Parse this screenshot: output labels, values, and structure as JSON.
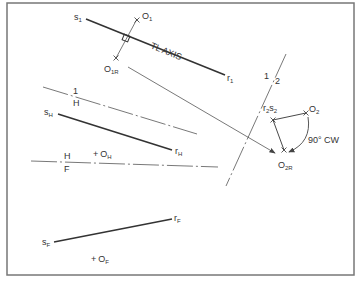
{
  "figure": {
    "frame": {
      "x": 7,
      "y": 3,
      "width": 347,
      "height": 272,
      "stroke": "#777777"
    },
    "colors": {
      "line": "#333333",
      "thin": "#555555",
      "text": "#333333"
    },
    "line_1": {
      "start_label": "s",
      "start_sub": "1",
      "end_label": "r",
      "end_sub": "1",
      "axis_label": "TL AXIS"
    },
    "point_O1": {
      "label": "O",
      "sub": "1"
    },
    "point_O1R": {
      "label": "O",
      "sub": "1R"
    },
    "fold_1H": {
      "top": "1",
      "bottom": "H"
    },
    "line_H": {
      "start_label": "s",
      "start_sub": "H",
      "end_label": "r",
      "end_sub": "H"
    },
    "point_OH": {
      "marker": "+",
      "label": "O",
      "sub": "H"
    },
    "fold_HF": {
      "top": "H",
      "bottom": "F"
    },
    "fold_12": {
      "left": "1",
      "right": "2"
    },
    "point_r2s2": {
      "label_a": "r",
      "sub_a": "2",
      "label_b": "s",
      "sub_b": "2"
    },
    "point_O2": {
      "label": "O",
      "sub": "2"
    },
    "point_O2R": {
      "label": "O",
      "sub": "2R"
    },
    "rotation": {
      "label": "90° CW"
    },
    "line_F": {
      "start_label": "s",
      "start_sub": "F",
      "end_label": "r",
      "end_sub": "F"
    },
    "point_OF": {
      "marker": "+",
      "label": "O",
      "sub": "F"
    }
  }
}
